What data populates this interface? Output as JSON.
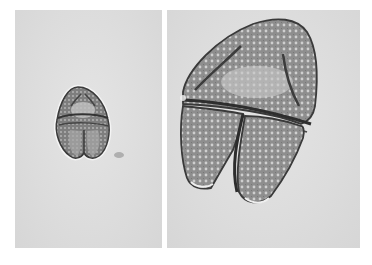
{
  "figure": {
    "type": "micrograph",
    "panels": [
      {
        "id": "left",
        "description": "pollen grain, low magnification",
        "bg": "#dedede",
        "grain_fill": "#8a8a8a",
        "grain_dark": "#3a3a3a"
      },
      {
        "id": "right",
        "description": "pollen grain, high magnification",
        "bg": "#dedede",
        "grain_fill": "#9a9a9a",
        "grain_dark": "#3c3c3c"
      }
    ],
    "artifacts": [
      {
        "panel": "left",
        "description": "dark smudge right of grain"
      }
    ]
  }
}
